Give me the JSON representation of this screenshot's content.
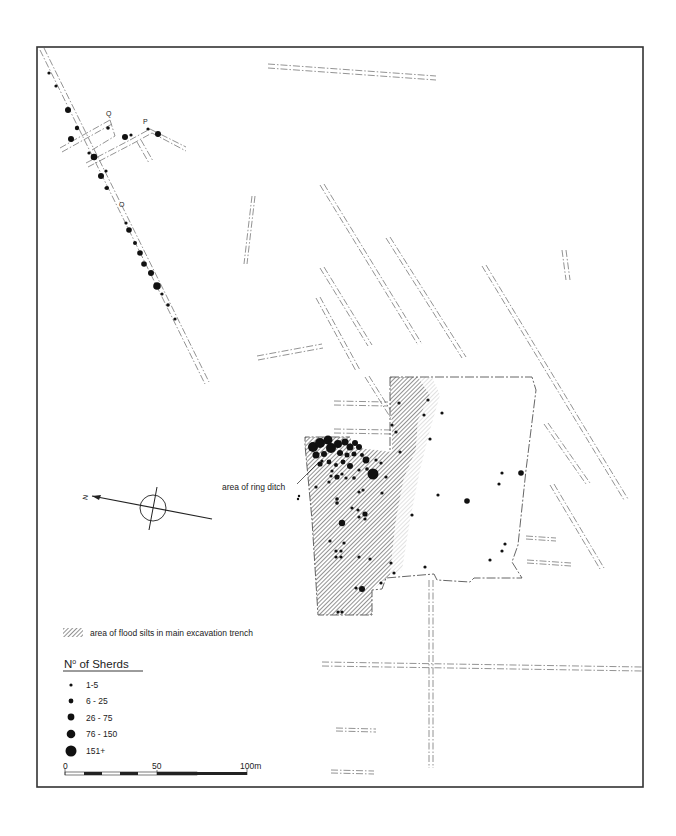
{
  "map": {
    "frame": {
      "x": 37,
      "y": 47,
      "w": 606,
      "h": 740
    },
    "trench_labels": [
      {
        "text": "Q",
        "x": 108,
        "y": 115
      },
      {
        "text": "P",
        "x": 146,
        "y": 124
      },
      {
        "text": "O",
        "x": 121,
        "y": 206
      }
    ],
    "annotation": {
      "text": "area of ring ditch",
      "x": 222,
      "y": 490
    },
    "north_arrow": {
      "letter": "N"
    },
    "legend": {
      "hatch_label": "area of flood silts in main excavation trench",
      "title": "No of Sherds",
      "title_sup": "o",
      "title_main": "N",
      "title_rest": " of  Sherds",
      "classes": [
        {
          "label": "1-5",
          "r": 1.6
        },
        {
          "label": "6 - 25",
          "r": 2.4
        },
        {
          "label": "26 - 75",
          "r": 3.3
        },
        {
          "label": "76 - 150",
          "r": 4.2
        },
        {
          "label": "151+",
          "r": 5.4
        }
      ]
    },
    "scale_bar": {
      "ticks": [
        "0",
        "50",
        "100m"
      ],
      "unit": "m"
    },
    "colors": {
      "ink": "#111111",
      "line": "#777777",
      "hatch": "#7a7a7a",
      "paper": "#ffffff"
    }
  }
}
